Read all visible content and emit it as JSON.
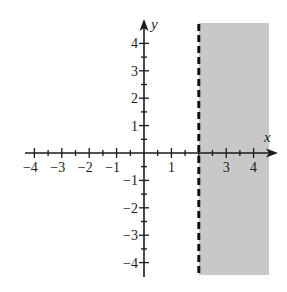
{
  "chart_data": {
    "type": "inequality-region",
    "title": "",
    "inequality": "x > 2",
    "boundary": {
      "kind": "vertical-line",
      "x": 2,
      "style": "dashed"
    },
    "shaded_region": {
      "side": "right",
      "x_from": 2,
      "x_to": 4.5,
      "y_from": -4.5,
      "y_to": 4.5,
      "color": "#c8c8c8"
    },
    "xlabel": "x",
    "ylabel": "y",
    "xlim": [
      -4.5,
      4.5
    ],
    "ylim": [
      -4.5,
      4.5
    ],
    "x_ticks": [
      -4,
      -3,
      -2,
      -1,
      1,
      3,
      4
    ],
    "x_tick_labels": [
      "−4",
      "−3",
      "−2",
      "−1",
      "1",
      "3",
      "4"
    ],
    "y_ticks": [
      4,
      3,
      2,
      1,
      -1,
      -2,
      -3,
      -4
    ],
    "y_tick_labels": [
      "4",
      "3",
      "2",
      "1",
      "−1",
      "−2",
      "−3",
      "−4"
    ],
    "minor_tick_step": 0.5,
    "grid": false,
    "legend": null
  },
  "colors": {
    "axis": "#1a1a1a",
    "shade": "#c8c8c8",
    "boundary": "#111111"
  }
}
